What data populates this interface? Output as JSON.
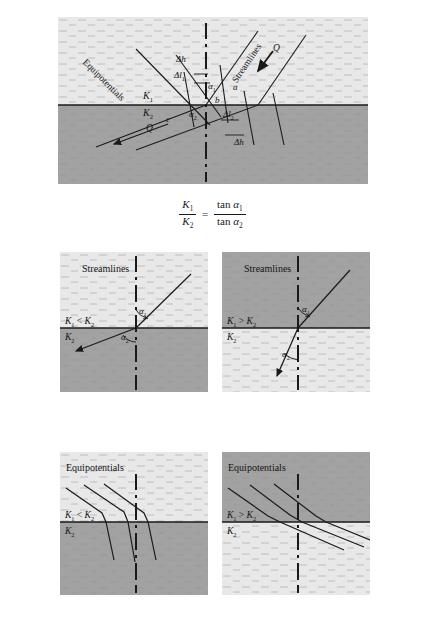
{
  "figure": {
    "title_equation": {
      "numerator_left": "K",
      "numerator_left_sub": "1",
      "denominator_left": "K",
      "denominator_left_sub": "2",
      "equals": "=",
      "numerator_right": "tan α",
      "numerator_right_sub": "1",
      "denominator_right": "tan α",
      "denominator_right_sub": "2",
      "plain": "K1/K2 = tan α1 / tan α2"
    },
    "colors": {
      "layer_light": "#e3e3e3",
      "layer_dark": "#9e9e9e",
      "line": "#1a1a1a",
      "background": "#ffffff"
    }
  },
  "main_panel": {
    "name": "refraction-of-flow-lines-at-interface",
    "layer_top_label": "K",
    "layer_top_sub": "1",
    "layer_bottom_label": "K",
    "layer_bottom_sub": "2",
    "labels": {
      "equipotentials": "Equipotentials",
      "streamlines": "Streamlines",
      "discharge_in": "Q",
      "discharge_out": "Q",
      "delta_h_top": "Δh",
      "delta_h_bottom": "Δh",
      "delta_l1": "Δl",
      "delta_l1_sub": "1",
      "delta_l2": "Δl",
      "delta_l2_sub": "2",
      "alpha1": "α",
      "alpha1_sub": "1",
      "alpha2": "α",
      "alpha2_sub": "2",
      "point_a": "a",
      "point_b": "b",
      "point_c": "c"
    }
  },
  "panels": [
    {
      "id": "streamlines-k1-lt-k2",
      "kind": "streamlines",
      "title": "Streamlines",
      "top_layer_shade": "light",
      "bottom_layer_shade": "dark",
      "condition": "K₁ < K₂",
      "condition_k": "K",
      "condition_k_sub": "1",
      "condition_op": "<",
      "condition_k2": "K",
      "condition_k2_sub": "2",
      "lower_layer_label": "K",
      "lower_layer_label_sub": "2",
      "alpha_upper": "α",
      "alpha_upper_sub": "1",
      "alpha_lower": "α",
      "alpha_lower_sub": "2",
      "description": "Streamline refracts away from the normal; alpha2 larger than alpha1"
    },
    {
      "id": "streamlines-k1-gt-k2",
      "kind": "streamlines",
      "title": "Streamlines",
      "top_layer_shade": "dark",
      "bottom_layer_shade": "light",
      "condition": "K₁ > K₂",
      "condition_k": "K",
      "condition_k_sub": "1",
      "condition_op": ">",
      "condition_k2": "K",
      "condition_k2_sub": "2",
      "lower_layer_label": "K",
      "lower_layer_label_sub": "2",
      "alpha_upper": "α",
      "alpha_upper_sub": "1",
      "alpha_lower": "α",
      "alpha_lower_sub": "2",
      "description": "Streamline refracts toward the normal; alpha2 smaller than alpha1"
    },
    {
      "id": "equipotentials-k1-lt-k2",
      "kind": "equipotentials",
      "title": "Equipotentials",
      "top_layer_shade": "light",
      "bottom_layer_shade": "dark",
      "condition": "K₁ < K₂",
      "condition_k": "K",
      "condition_k_sub": "1",
      "condition_op": "<",
      "condition_k2": "K",
      "condition_k2_sub": "2",
      "lower_layer_label": "K",
      "lower_layer_label_sub": "2",
      "description": "Equipotential lines steepen in the lower more permeable layer"
    },
    {
      "id": "equipotentials-k1-gt-k2",
      "kind": "equipotentials",
      "title": "Equipotentials",
      "top_layer_shade": "dark",
      "bottom_layer_shade": "light",
      "condition": "K₁ > K₂",
      "condition_k": "K",
      "condition_k_sub": "1",
      "condition_op": ">",
      "condition_k2": "K",
      "condition_k2_sub": "2",
      "lower_layer_label": "K",
      "lower_layer_label_sub": "2",
      "description": "Equipotential lines flatten in the lower less permeable layer"
    }
  ]
}
